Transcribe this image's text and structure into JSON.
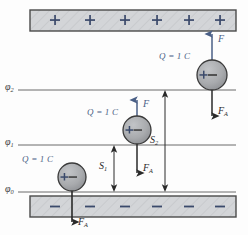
{
  "figure": {
    "type": "physics-diagram",
    "background": "#fdfdfd"
  },
  "colors": {
    "plate_fill": "#d3d5d8",
    "plate_stroke": "#4a4a4a",
    "plate_sign": "#3b4a6b",
    "ball_fill": "#a9abae",
    "ball_stroke": "#3a3a3a",
    "force_blue": "#4a5f86",
    "force_black": "#2a2a2a",
    "equipotential_line": "#6a6a6a"
  },
  "plates": {
    "top": {
      "name": "positive-plate",
      "sign": "+",
      "count": 6,
      "signs": [
        "+",
        "+",
        "+",
        "+",
        "+",
        "+"
      ]
    },
    "bottom": {
      "name": "negative-plate",
      "sign": "−",
      "count": 6,
      "signs": [
        "−",
        "−",
        "−",
        "−",
        "−",
        "−"
      ]
    }
  },
  "equipotentials": [
    {
      "id": "phi2",
      "label": "φ",
      "subscript": "2",
      "y": 90
    },
    {
      "id": "phi1",
      "label": "φ",
      "subscript": "1",
      "y": 145
    },
    {
      "id": "phi0",
      "label": "φ",
      "subscript": "0",
      "y": 192
    }
  ],
  "charges": [
    {
      "id": "charge-top",
      "label": "Q = 1 C",
      "symbol": "+−",
      "on_line": "phi2",
      "force_up": {
        "label": "F",
        "direction": "up",
        "color": "blue"
      },
      "force_down": {
        "label": "F",
        "subscript": "A",
        "direction": "down",
        "color": "black"
      }
    },
    {
      "id": "charge-middle",
      "label": "Q = 1 C",
      "symbol": "+−",
      "on_line": "phi1",
      "force_up": {
        "label": "F",
        "direction": "up",
        "color": "blue"
      },
      "force_down": {
        "label": "F",
        "subscript": "A",
        "direction": "down",
        "color": "black"
      }
    },
    {
      "id": "charge-bottom",
      "label": "Q = 1 C",
      "symbol": "+−",
      "on_line": "phi0",
      "force_down": {
        "label": "F",
        "subscript": "A",
        "direction": "down",
        "color": "black"
      }
    }
  ],
  "distances": [
    {
      "id": "s1",
      "label": "S",
      "subscript": "1",
      "from": "phi0",
      "to": "phi1"
    },
    {
      "id": "s2",
      "label": "S",
      "subscript": "2",
      "from": "phi0",
      "to": "phi2"
    }
  ],
  "labels": {
    "phi2": "φ",
    "phi2_sub": "2",
    "phi1": "φ",
    "phi1_sub": "1",
    "phi0": "φ",
    "phi0_sub": "0",
    "q_top": "Q = 1 C",
    "q_mid": "Q = 1 C",
    "q_bot": "Q = 1 C",
    "f_top": "F",
    "f_mid": "F",
    "fa_top": "F",
    "fa_top_sub": "A",
    "fa_mid": "F",
    "fa_mid_sub": "A",
    "fa_bot": "F",
    "fa_bot_sub": "A",
    "s1": "S",
    "s1_sub": "1",
    "s2": "S",
    "s2_sub": "2"
  }
}
